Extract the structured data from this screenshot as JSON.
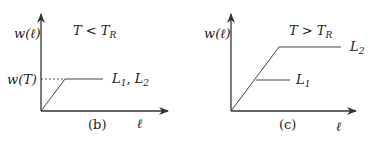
{
  "panels": [
    {
      "id": "b",
      "caption": "(b)",
      "condition": {
        "lhs": "T",
        "op": " < ",
        "rhs": "T",
        "rhs_sub": "R"
      },
      "y_axis_label": "w(ℓ)",
      "x_axis_label": "ℓ",
      "y_tick_label": "w(T)",
      "curve_label": {
        "a": "L",
        "a_sub": "1",
        "sep": ", ",
        "b": "L",
        "b_sub": "2"
      }
    },
    {
      "id": "c",
      "caption": "(c)",
      "condition": {
        "lhs": "T",
        "op": " > ",
        "rhs": "T",
        "rhs_sub": "R"
      },
      "y_axis_label": "w(ℓ)",
      "x_axis_label": "ℓ",
      "curve_labels": [
        {
          "name": "L",
          "sub": "2"
        },
        {
          "name": "L",
          "sub": "1"
        }
      ]
    }
  ],
  "colors": {
    "line": "#333333",
    "text": "#222222"
  }
}
